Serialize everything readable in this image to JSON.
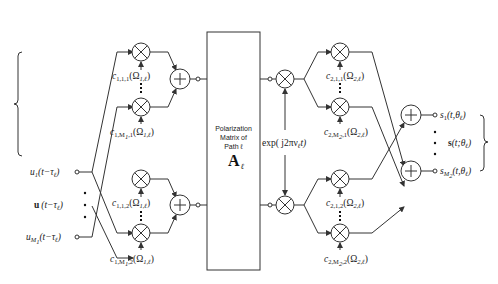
{
  "inputs": {
    "first": "u",
    "first_sub": "1",
    "first_arg": "(t−τ",
    "first_arg_sub": "ℓ",
    "vector": "u",
    "vector_arg": "(t−τ",
    "vector_arg_sub": "ℓ",
    "last": "u",
    "last_sub": "M",
    "last_subsub": "1",
    "last_arg": "(t−τ",
    "last_arg_sub": "ℓ",
    "close_paren": ")"
  },
  "tx_coeffs": {
    "top_first": {
      "base": "c",
      "sub": "1,1,1",
      "arg": "(Ω",
      "arg_sub": "1,ℓ",
      "close": ")"
    },
    "top_last": {
      "base": "c",
      "sub": "1,M",
      "subsub": "1",
      "sub2": ",1",
      "arg": "(Ω",
      "arg_sub": "1,ℓ",
      "close": ")"
    },
    "bot_first": {
      "base": "c",
      "sub": "1,1,2",
      "arg": "(Ω",
      "arg_sub": "1,ℓ",
      "close": ")"
    },
    "bot_last": {
      "base": "c",
      "sub": "1,M",
      "subsub": "1",
      "sub2": ",2",
      "arg": "(Ω",
      "arg_sub": "1,ℓ",
      "close": ")"
    }
  },
  "polarization_box": {
    "line1": "Polarization",
    "line2": "Matrix of",
    "line3": "Path ℓ",
    "symbol": "A",
    "symbol_sub": "ℓ"
  },
  "doppler": {
    "text": "exp( j2πν",
    "sub": "ℓ",
    "tail": "t)"
  },
  "rx_coeffs": {
    "top_first": {
      "base": "c",
      "sub": "2,1,1",
      "arg": "(Ω",
      "arg_sub": "2,ℓ",
      "close": ")"
    },
    "top_last": {
      "base": "c",
      "sub": "2,M",
      "subsub": "2",
      "sub2": ",1",
      "arg": "(Ω",
      "arg_sub": "2,ℓ",
      "close": ")"
    },
    "bot_first": {
      "base": "c",
      "sub": "2,1,2",
      "arg": "(Ω",
      "arg_sub": "2,ℓ",
      "close": ")"
    },
    "bot_last": {
      "base": "c",
      "sub": "2,M",
      "subsub": "2",
      "sub2": ",2",
      "arg": "(Ω",
      "arg_sub": "2,ℓ",
      "close": ")"
    }
  },
  "outputs": {
    "first": "s",
    "first_sub": "1",
    "first_arg": "(t,θ",
    "first_arg_sub": "ℓ",
    "vector": "s",
    "vector_arg": "(t;θ",
    "vector_arg_sub": "ℓ",
    "last": "s",
    "last_sub": "M",
    "last_subsub": "2",
    "last_arg": "(t,θ",
    "last_arg_sub": "ℓ",
    "close_paren": ")"
  }
}
